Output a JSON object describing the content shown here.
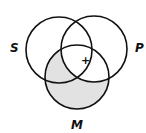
{
  "diagram": {
    "type": "venn-3",
    "circles": [
      {
        "id": "S",
        "label": "S",
        "cx": 56,
        "cy": 50,
        "r": 33
      },
      {
        "id": "P",
        "label": "P",
        "cx": 94,
        "cy": 50,
        "r": 33
      },
      {
        "id": "M",
        "label": "M",
        "cx": 75,
        "cy": 77,
        "r": 33
      }
    ],
    "shaded_regions": [
      "M only",
      "S∩M not P"
    ],
    "markers": [
      {
        "symbol": "+",
        "region": "S∩P∩M boundary"
      }
    ],
    "colors": {
      "stroke": "#111111",
      "shade": "#e0e0e0",
      "background": "#ffffff"
    }
  },
  "labels": {
    "s": "S",
    "p": "P",
    "m": "M",
    "plus": "+"
  }
}
